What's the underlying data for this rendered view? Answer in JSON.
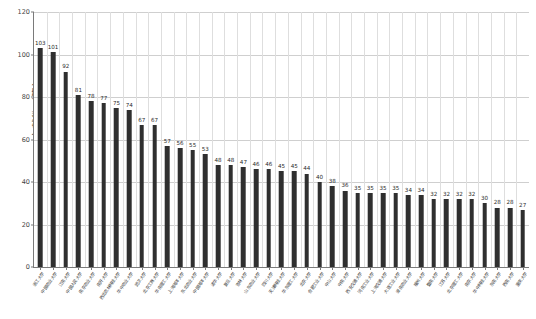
{
  "chart_data": {
    "type": "bar",
    "title": "",
    "xlabel": "",
    "ylabel": "文献数（篇）",
    "ylim": [
      0,
      120
    ],
    "yticks": [
      0,
      20,
      40,
      60,
      80,
      100,
      120
    ],
    "grid": true,
    "legend": false,
    "bar_color": "#2f2f2f",
    "categories": [
      "浙江大学",
      "中国农业大学",
      "江南大学",
      "中国人民大学",
      "南京农业大学",
      "南开大学",
      "西北农林科技大学",
      "华中农业大学",
      "武汉大学",
      "北京工商大学",
      "华南理工大学",
      "上海海洋大学",
      "东北农业大学",
      "中国海洋大学",
      "清华大学",
      "复旦大学",
      "吉林大学",
      "山东农业大学",
      "四川大学",
      "天津科技大学",
      "华东理工大学",
      "北京大学",
      "合肥工业大学",
      "中山大学",
      "中南大学",
      "西安交通大学",
      "河南工业大学",
      "上海交通大学",
      "大连工业大学",
      "湖南农业大学",
      "福州大学",
      "暨南大学",
      "江苏大学",
      "北京理工大学",
      "南京大学",
      "华中科技大学",
      "东南大学",
      "西南大学",
      "重庆大学"
    ],
    "values": [
      103,
      101,
      92,
      81,
      78,
      77,
      75,
      74,
      67,
      67,
      57,
      56,
      55,
      53,
      48,
      48,
      47,
      46,
      46,
      45,
      45,
      44,
      40,
      38,
      36,
      35,
      35,
      35,
      35,
      34,
      34,
      32,
      32,
      32,
      32,
      30,
      28,
      28,
      27
    ]
  }
}
